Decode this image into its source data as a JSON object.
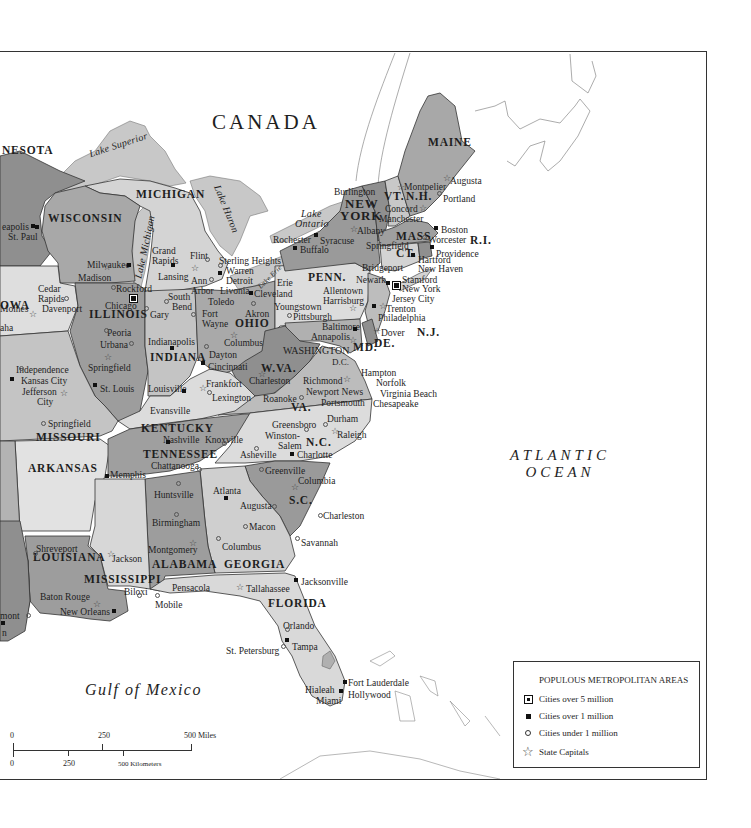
{
  "map": {
    "country_label": "CANADA",
    "ocean_label_line1": "ATLANTIC",
    "ocean_label_line2": "OCEAN",
    "gulf_label": "Gulf of Mexico",
    "lakes": {
      "superior": "Lake Superior",
      "michigan": "Lake Michigan",
      "huron": "Lake Huron",
      "erie": "Lake Erie",
      "ontario_line1": "Lake",
      "ontario_line2": "Ontario"
    },
    "states": {
      "minnesota": "NESOTA",
      "wisconsin": "WISCONSIN",
      "michigan": "MICHIGAN",
      "iowa": "OWA",
      "illinois": "ILLINOIS",
      "indiana": "INDIANA",
      "ohio": "OHIO",
      "missouri": "MISSOURI",
      "arkansas": "ARKANSAS",
      "louisiana": "LOUISIANA",
      "mississippi": "MISSISSIPPI",
      "alabama": "ALABAMA",
      "georgia": "GEORGIA",
      "florida": "FLORIDA",
      "tennessee": "TENNESSEE",
      "kentucky": "KENTUCKY",
      "wva": "W.VA.",
      "va": "VA.",
      "nc": "N.C.",
      "sc": "S.C.",
      "md": "MD.",
      "de": "DE.",
      "nj": "N.J.",
      "penn": "PENN.",
      "new_york_line1": "NEW",
      "new_york_line2": "YORK",
      "vt": "VT.",
      "nh": "N.H.",
      "mass": "MASS",
      "ct": "CT.",
      "ri": "R.I.",
      "maine": "MAINE",
      "washington_dc_line1": "WASHINGTON",
      "washington_dc_line2": "D.C."
    },
    "cities": [
      {
        "name": "eapolis",
        "x": 2,
        "y": 221,
        "type": "1m",
        "mx": 33,
        "my": 225
      },
      {
        "name": "St. Paul",
        "x": 8,
        "y": 231,
        "type": "1m",
        "mx": 37,
        "my": 226
      },
      {
        "name": "Milwaukee",
        "x": 87,
        "y": 259,
        "type": "1m",
        "mx": 129,
        "my": 264
      },
      {
        "name": "Madison",
        "x": 78,
        "y": 272,
        "type": "cap",
        "mx": 105,
        "my": 264
      },
      {
        "name": "Rockford",
        "x": 116,
        "y": 283,
        "type": "small",
        "mx": 113,
        "my": 286
      },
      {
        "name": "Chicago",
        "x": 105,
        "y": 300,
        "type": "big",
        "mx": 132,
        "my": 296
      },
      {
        "name": "Gary",
        "x": 150,
        "y": 309,
        "type": "small",
        "mx": 146,
        "my": 307
      },
      {
        "name": "Grand",
        "x": 152,
        "y": 245,
        "type": "none"
      },
      {
        "name": "Rapids",
        "x": 152,
        "y": 255,
        "type": "1m",
        "mx": 173,
        "my": 264
      },
      {
        "name": "Lansing",
        "x": 158,
        "y": 271,
        "type": "cap",
        "mx": 193,
        "my": 265
      },
      {
        "name": "Flint",
        "x": 190,
        "y": 250,
        "type": "small",
        "mx": 207,
        "my": 258
      },
      {
        "name": "Sterling Heights",
        "x": 219,
        "y": 255,
        "type": "small",
        "mx": 220,
        "my": 264
      },
      {
        "name": "Warren",
        "x": 226,
        "y": 265,
        "type": "1m",
        "mx": 220,
        "my": 272
      },
      {
        "name": "Detroit",
        "x": 226,
        "y": 275,
        "type": "none"
      },
      {
        "name": "Ann",
        "x": 191,
        "y": 275,
        "type": "small",
        "mx": 211,
        "my": 278
      },
      {
        "name": "Arbor",
        "x": 191,
        "y": 285,
        "type": "none"
      },
      {
        "name": "Livonia",
        "x": 220,
        "y": 285,
        "type": "none"
      },
      {
        "name": "South",
        "x": 168,
        "y": 291,
        "type": "none"
      },
      {
        "name": "Bend",
        "x": 172,
        "y": 301,
        "type": "small",
        "mx": 166,
        "my": 300
      },
      {
        "name": "Toledo",
        "x": 208,
        "y": 296,
        "type": "none"
      },
      {
        "name": "Fort",
        "x": 202,
        "y": 308,
        "type": "small",
        "mx": 193,
        "my": 313
      },
      {
        "name": "Wayne",
        "x": 202,
        "y": 318,
        "type": "none"
      },
      {
        "name": "Akron",
        "x": 245,
        "y": 308,
        "type": "small",
        "mx": 253,
        "my": 302
      },
      {
        "name": "Erie",
        "x": 277,
        "y": 277,
        "type": "none"
      },
      {
        "name": "Cleveland",
        "x": 254,
        "y": 288,
        "type": "1m",
        "mx": 251,
        "my": 292
      },
      {
        "name": "Youngstown",
        "x": 274,
        "y": 301,
        "type": "none"
      },
      {
        "name": "Pittsburgh",
        "x": 293,
        "y": 311,
        "type": "small",
        "mx": 289,
        "my": 314
      },
      {
        "name": "Rochester",
        "x": 273,
        "y": 234,
        "type": "1m",
        "mx": 316,
        "my": 234
      },
      {
        "name": "Syracuse",
        "x": 320,
        "y": 235,
        "type": "none"
      },
      {
        "name": "Buffalo",
        "x": 300,
        "y": 244,
        "type": "1m",
        "mx": 295,
        "my": 247
      },
      {
        "name": "Burlington",
        "x": 334,
        "y": 186,
        "type": "none"
      },
      {
        "name": "Albany",
        "x": 357,
        "y": 225,
        "type": "cap",
        "mx": 352,
        "my": 226
      },
      {
        "name": "Springfield",
        "x": 366,
        "y": 240,
        "type": "none"
      },
      {
        "name": "Montpelier",
        "x": 404,
        "y": 181,
        "type": "cap",
        "mx": 399,
        "my": 184
      },
      {
        "name": "Concord",
        "x": 385,
        "y": 203,
        "type": "cap",
        "mx": 421,
        "my": 205
      },
      {
        "name": "Manchester",
        "x": 379,
        "y": 213,
        "type": "none"
      },
      {
        "name": "Augusta",
        "x": 450,
        "y": 175,
        "type": "cap",
        "mx": 445,
        "my": 175
      },
      {
        "name": "Portland",
        "x": 443,
        "y": 193,
        "type": "small",
        "mx": 439,
        "my": 192
      },
      {
        "name": "Boston",
        "x": 441,
        "y": 224,
        "type": "1m",
        "mx": 436,
        "my": 227
      },
      {
        "name": "Worcester",
        "x": 428,
        "y": 234,
        "type": "small",
        "mx": 424,
        "my": 236
      },
      {
        "name": "Providence",
        "x": 436,
        "y": 248,
        "type": "1m",
        "mx": 432,
        "my": 246
      },
      {
        "name": "Hartford",
        "x": 418,
        "y": 254,
        "type": "1m",
        "mx": 413,
        "my": 254
      },
      {
        "name": "New Haven",
        "x": 418,
        "y": 263,
        "type": "none"
      },
      {
        "name": "Bridgeport",
        "x": 362,
        "y": 262,
        "type": "none"
      },
      {
        "name": "Stamford",
        "x": 402,
        "y": 274,
        "type": "none"
      },
      {
        "name": "Newark",
        "x": 356,
        "y": 274,
        "type": "1m",
        "mx": 388,
        "my": 282
      },
      {
        "name": "New York",
        "x": 402,
        "y": 283,
        "type": "big",
        "mx": 395,
        "my": 283
      },
      {
        "name": "Jersey City",
        "x": 392,
        "y": 293,
        "type": "none"
      },
      {
        "name": "Allentown",
        "x": 323,
        "y": 285,
        "type": "none"
      },
      {
        "name": "Harrisburg",
        "x": 323,
        "y": 295,
        "type": "cap",
        "mx": 351,
        "my": 305
      },
      {
        "name": "Trenton",
        "x": 386,
        "y": 303,
        "type": "cap",
        "mx": 381,
        "my": 303
      },
      {
        "name": "Philadelphia",
        "x": 378,
        "y": 312,
        "type": "1m",
        "mx": 374,
        "my": 305
      },
      {
        "name": "Baltimore",
        "x": 322,
        "y": 321,
        "type": "1m",
        "mx": 355,
        "my": 328
      },
      {
        "name": "Annapolis",
        "x": 311,
        "y": 331,
        "type": "cap",
        "mx": 351,
        "my": 337
      },
      {
        "name": "Dover",
        "x": 381,
        "y": 327,
        "type": "cap",
        "mx": 375,
        "my": 328
      },
      {
        "name": "Indianapolis",
        "x": 148,
        "y": 336,
        "type": "1m",
        "mx": 172,
        "my": 347
      },
      {
        "name": "Dayton",
        "x": 209,
        "y": 349,
        "type": "small",
        "mx": 206,
        "my": 345
      },
      {
        "name": "Columbus",
        "x": 224,
        "y": 337,
        "type": "cap",
        "mx": 232,
        "my": 332
      },
      {
        "name": "Cincinnati",
        "x": 208,
        "y": 361,
        "type": "1m",
        "mx": 203,
        "my": 362
      },
      {
        "name": "Peoria",
        "x": 107,
        "y": 327,
        "type": "small",
        "mx": 106,
        "my": 329
      },
      {
        "name": "Urbana",
        "x": 100,
        "y": 339,
        "type": "small",
        "mx": 131,
        "my": 342
      },
      {
        "name": "Springfield",
        "x": 88,
        "y": 362,
        "type": "cap",
        "mx": 106,
        "my": 354
      },
      {
        "name": "Cedar",
        "x": 38,
        "y": 283,
        "type": "none"
      },
      {
        "name": "Rapids",
        "x": 38,
        "y": 293,
        "type": "small",
        "mx": 66,
        "my": 297
      },
      {
        "name": "Davenport",
        "x": 42,
        "y": 303,
        "type": "none"
      },
      {
        "name": "Moines",
        "x": 0,
        "y": 303,
        "type": "cap",
        "mx": 31,
        "my": 311
      },
      {
        "name": "aha",
        "x": 0,
        "y": 322,
        "type": "none"
      },
      {
        "name": "Independence",
        "x": 16,
        "y": 364,
        "type": "small",
        "mx": 21,
        "my": 367
      },
      {
        "name": "Kansas City",
        "x": 21,
        "y": 375,
        "type": "1m",
        "mx": 12,
        "my": 378
      },
      {
        "name": "Jefferson",
        "x": 22,
        "y": 386,
        "type": "cap",
        "mx": 62,
        "my": 390
      },
      {
        "name": "City",
        "x": 37,
        "y": 396,
        "type": "none"
      },
      {
        "name": "St. Louis",
        "x": 100,
        "y": 383,
        "type": "1m",
        "mx": 95,
        "my": 384
      },
      {
        "name": "Springfield",
        "x": 48,
        "y": 418,
        "type": "small",
        "mx": 43,
        "my": 422
      },
      {
        "name": "Louisville",
        "x": 148,
        "y": 383,
        "type": "1m",
        "mx": 184,
        "my": 390
      },
      {
        "name": "Frankfort",
        "x": 206,
        "y": 378,
        "type": "cap",
        "mx": 201,
        "my": 385
      },
      {
        "name": "Lexington",
        "x": 212,
        "y": 392,
        "type": "small",
        "mx": 209,
        "my": 391
      },
      {
        "name": "Evansville",
        "x": 150,
        "y": 405,
        "type": "none"
      },
      {
        "name": "Charleston",
        "x": 249,
        "y": 375,
        "type": "cap",
        "mx": 260,
        "my": 371
      },
      {
        "name": "Roanoke",
        "x": 263,
        "y": 393,
        "type": "small",
        "mx": 301,
        "my": 396
      },
      {
        "name": "Richmond",
        "x": 303,
        "y": 375,
        "type": "cap",
        "mx": 345,
        "my": 376
      },
      {
        "name": "Newport News",
        "x": 306,
        "y": 386,
        "type": "none"
      },
      {
        "name": "Portsmouth",
        "x": 321,
        "y": 397,
        "type": "none"
      },
      {
        "name": "Hampton",
        "x": 361,
        "y": 367,
        "type": "none"
      },
      {
        "name": "Norfolk",
        "x": 376,
        "y": 377,
        "type": "none"
      },
      {
        "name": "Virginia Beach",
        "x": 380,
        "y": 388,
        "type": "none"
      },
      {
        "name": "Chesapeake",
        "x": 373,
        "y": 398,
        "type": "none"
      },
      {
        "name": "Durham",
        "x": 327,
        "y": 413,
        "type": "small",
        "mx": 325,
        "my": 423
      },
      {
        "name": "Raleigh",
        "x": 337,
        "y": 429,
        "type": "cap",
        "mx": 333,
        "my": 428
      },
      {
        "name": "Greensboro",
        "x": 272,
        "y": 419,
        "type": "small",
        "mx": 306,
        "my": 428
      },
      {
        "name": "Winston-",
        "x": 265,
        "y": 430,
        "type": "none"
      },
      {
        "name": "Salem",
        "x": 278,
        "y": 440,
        "type": "none"
      },
      {
        "name": "Charlotte",
        "x": 297,
        "y": 449,
        "type": "1m",
        "mx": 292,
        "my": 453
      },
      {
        "name": "Asheville",
        "x": 240,
        "y": 449,
        "type": "small",
        "mx": 256,
        "my": 447
      },
      {
        "name": "Nashville",
        "x": 163,
        "y": 434,
        "type": "1m",
        "mx": 168,
        "my": 441
      },
      {
        "name": "Knoxville",
        "x": 205,
        "y": 434,
        "type": "small",
        "mx": 224,
        "my": 442
      },
      {
        "name": "Chattanooga",
        "x": 151,
        "y": 460,
        "type": "small",
        "mx": 199,
        "my": 468
      },
      {
        "name": "Memphis",
        "x": 110,
        "y": 469,
        "type": "1m",
        "mx": 107,
        "my": 475
      },
      {
        "name": "Greenville",
        "x": 265,
        "y": 465,
        "type": "small",
        "mx": 261,
        "my": 468
      },
      {
        "name": "Columbia",
        "x": 298,
        "y": 475,
        "type": "cap",
        "mx": 293,
        "my": 484
      },
      {
        "name": "Charleston",
        "x": 323,
        "y": 510,
        "type": "small",
        "mx": 320,
        "my": 514
      },
      {
        "name": "Savannah",
        "x": 301,
        "y": 537,
        "type": "small",
        "mx": 297,
        "my": 537
      },
      {
        "name": "Atlanta",
        "x": 213,
        "y": 485,
        "type": "1m",
        "mx": 226,
        "my": 497
      },
      {
        "name": "Augusta",
        "x": 240,
        "y": 500,
        "type": "small",
        "mx": 274,
        "my": 505
      },
      {
        "name": "Macon",
        "x": 249,
        "y": 521,
        "type": "small",
        "mx": 245,
        "my": 525
      },
      {
        "name": "Columbus",
        "x": 222,
        "y": 541,
        "type": "small",
        "mx": 218,
        "my": 537
      },
      {
        "name": "Huntsville",
        "x": 154,
        "y": 489,
        "type": "small",
        "mx": 178,
        "my": 482
      },
      {
        "name": "Birmingham",
        "x": 152,
        "y": 517,
        "type": "small",
        "mx": 176,
        "my": 513
      },
      {
        "name": "Montgomery",
        "x": 148,
        "y": 544,
        "type": "cap",
        "mx": 191,
        "my": 540
      },
      {
        "name": "Jackson",
        "x": 112,
        "y": 553,
        "type": "cap",
        "mx": 109,
        "my": 551
      },
      {
        "name": "Shreveport",
        "x": 36,
        "y": 543,
        "type": "small",
        "mx": 35,
        "my": 552
      },
      {
        "name": "Baton Rouge",
        "x": 40,
        "y": 591,
        "type": "cap",
        "mx": 95,
        "my": 601
      },
      {
        "name": "New Orleans",
        "x": 60,
        "y": 606,
        "type": "1m",
        "mx": 114,
        "my": 610
      },
      {
        "name": "Biloxi",
        "x": 124,
        "y": 586,
        "type": "small",
        "mx": 139,
        "my": 594
      },
      {
        "name": "Mobile",
        "x": 155,
        "y": 599,
        "type": "small",
        "mx": 157,
        "my": 594
      },
      {
        "name": "Pensacola",
        "x": 172,
        "y": 582,
        "type": "none"
      },
      {
        "name": "Tallahassee",
        "x": 246,
        "y": 583,
        "type": "cap",
        "mx": 238,
        "my": 584
      },
      {
        "name": "Jacksonville",
        "x": 301,
        "y": 576,
        "type": "1m",
        "mx": 296,
        "my": 579
      },
      {
        "name": "Orlando",
        "x": 283,
        "y": 620,
        "type": "small",
        "mx": 287,
        "my": 628
      },
      {
        "name": "Tampa",
        "x": 292,
        "y": 641,
        "type": "1m",
        "mx": 287,
        "my": 639
      },
      {
        "name": "St. Petersburg",
        "x": 226,
        "y": 645,
        "type": "small",
        "mx": 283,
        "my": 645
      },
      {
        "name": "Fort Lauderdale",
        "x": 348,
        "y": 677,
        "type": "1m",
        "mx": 345,
        "my": 681
      },
      {
        "name": "Hialeah",
        "x": 305,
        "y": 684,
        "type": "none"
      },
      {
        "name": "Hollywood",
        "x": 348,
        "y": 689,
        "type": "none"
      },
      {
        "name": "Miami",
        "x": 316,
        "y": 695,
        "type": "1m",
        "mx": 341,
        "my": 690
      },
      {
        "name": "mont",
        "x": 0,
        "y": 610,
        "type": "small",
        "mx": 28,
        "my": 614
      },
      {
        "name": "n",
        "x": 2,
        "y": 627,
        "type": "1m",
        "mx": 3,
        "my": 622
      }
    ]
  },
  "scale_bar": {
    "miles_0": "0",
    "miles_250": "250",
    "miles_500": "500 Miles",
    "km_0": "0",
    "km_250": "250",
    "km_500": "500 Kilometers"
  },
  "legend": {
    "title": "POPULOUS METROPOLITAN AREAS",
    "items": [
      {
        "symbol": "square-outlined",
        "label": "Cities over 5 million"
      },
      {
        "symbol": "square-filled",
        "label": "Cities over 1 million"
      },
      {
        "symbol": "circle-open",
        "label": "Cities under 1 million"
      },
      {
        "symbol": "star",
        "label": "State Capitals"
      }
    ]
  },
  "colors": {
    "lake": "#c8c8c8",
    "land_light": "#d9d9d9",
    "land_mid": "#bdbdbd",
    "land_dark": "#9d9d9d",
    "land_darker": "#8c8c8c",
    "border": "#333333"
  }
}
